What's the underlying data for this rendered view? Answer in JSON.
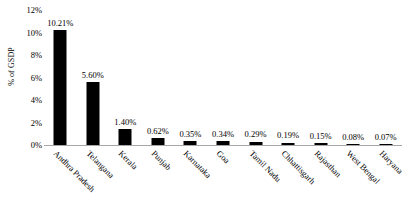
{
  "chart_data": {
    "type": "bar",
    "title": "",
    "xlabel": "",
    "ylabel": "% of GSDP",
    "categories": [
      "Andhra Pradesh",
      "Telangana",
      "Kerala",
      "Punjab",
      "Karnataka",
      "Goa",
      "Tamil Nadu",
      "Chhattisgarh",
      "Rajasthan",
      "West Bengal",
      "Haryana"
    ],
    "values": [
      10.21,
      5.6,
      1.4,
      0.62,
      0.35,
      0.34,
      0.29,
      0.19,
      0.15,
      0.08,
      0.07
    ],
    "value_labels": [
      "10.21%",
      "5.60%",
      "1.40%",
      "0.62%",
      "0.35%",
      "0.34%",
      "0.29%",
      "0.19%",
      "0.15%",
      "0.08%",
      "0.07%"
    ],
    "ylim": [
      0,
      12
    ],
    "ytick_values": [
      0,
      2,
      4,
      6,
      8,
      10,
      12
    ],
    "ytick_labels": [
      "0%",
      "2%",
      "4%",
      "6%",
      "8%",
      "10%",
      "12%"
    ],
    "grid": false,
    "legend": false,
    "bar_color": "#000000",
    "axis_color": "#a6a6a6",
    "background_color": "#ffffff"
  }
}
